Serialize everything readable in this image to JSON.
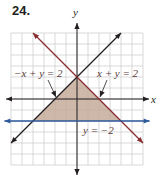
{
  "problem_number": "24.",
  "chart_data": {
    "type": "line",
    "title": "",
    "xlabel": "x",
    "ylabel": "y",
    "xlim": [
      -6,
      6
    ],
    "ylim": [
      -6,
      6
    ],
    "grid": true,
    "grid_step": 1,
    "tick_labels_shown": false,
    "series": [
      {
        "name": "-x + y = 2",
        "equation": "y = x + 2",
        "slope": 1,
        "intercept": 2,
        "color": "#231f20",
        "label": "−x + y = 2",
        "x_range": [
          -6,
          4
        ]
      },
      {
        "name": "x + y = 2",
        "equation": "y = -x + 2",
        "slope": -1,
        "intercept": 2,
        "color": "#8b2a2e",
        "label": "x + y = 2",
        "x_range": [
          -4,
          6
        ]
      },
      {
        "name": "y = -2",
        "equation": "y = -2",
        "slope": 0,
        "intercept": -2,
        "color": "#2e5a9c",
        "label": "y = −2",
        "x_range": [
          -6.6,
          6.6
        ]
      }
    ],
    "shaded_region": {
      "description": "Triangle bounded by y <= x + 2, y <= -x + 2, y >= -2",
      "vertices": [
        [
          0,
          2
        ],
        [
          -4,
          -2
        ],
        [
          4,
          -2
        ]
      ],
      "color": "#c4ab9a"
    },
    "annotations": [
      {
        "text": "−x + y = 2",
        "points_to": [
          -2,
          0
        ]
      },
      {
        "text": "x + y = 2",
        "points_to": [
          2,
          0
        ]
      },
      {
        "text": "y = −2",
        "points_to": null
      }
    ]
  }
}
